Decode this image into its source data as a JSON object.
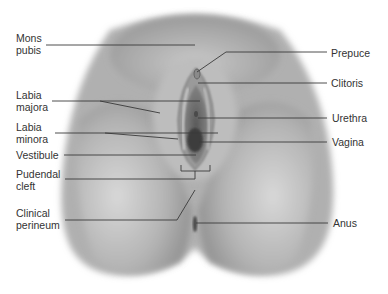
{
  "figure": {
    "labels_left": [
      {
        "id": "mons-pubis",
        "text": "Mons\npubis",
        "x": 16,
        "y": 32
      },
      {
        "id": "labia-majora",
        "text": "Labia\nmajora",
        "x": 16,
        "y": 90
      },
      {
        "id": "labia-minora",
        "text": "Labia\nminora",
        "x": 16,
        "y": 122
      },
      {
        "id": "vestibule",
        "text": "Vestibule",
        "x": 16,
        "y": 150
      },
      {
        "id": "pudendal-cleft",
        "text": "Pudendal\ncleft",
        "x": 16,
        "y": 170
      },
      {
        "id": "clinical-perineum",
        "text": "Clinical\nperineum",
        "x": 16,
        "y": 207
      }
    ],
    "labels_right": [
      {
        "id": "prepuce",
        "text": "Prepuce",
        "x": 331,
        "y": 47
      },
      {
        "id": "clitoris",
        "text": "Clitoris",
        "x": 331,
        "y": 77
      },
      {
        "id": "urethra",
        "text": "Urethra",
        "x": 332,
        "y": 112
      },
      {
        "id": "vagina",
        "text": "Vagina",
        "x": 332,
        "y": 136
      },
      {
        "id": "anus",
        "text": "Anus",
        "x": 333,
        "y": 216
      }
    ],
    "colors": {
      "label_text": "#333333",
      "leader_line": "#3a3a3a",
      "skin_light": "#d4d4d4",
      "skin_mid": "#a8a8a8",
      "skin_dark": "#6e6e6e",
      "background": "#ffffff"
    }
  }
}
